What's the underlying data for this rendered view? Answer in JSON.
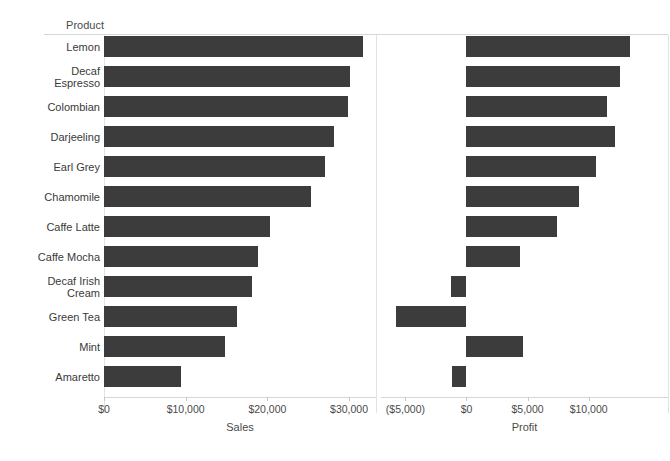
{
  "header": {
    "field_caption": "Product"
  },
  "chart_data": {
    "type": "bar",
    "title": "",
    "orientation": "horizontal",
    "categories": [
      "Lemon",
      "Decaf Espresso",
      "Colombian",
      "Darjeeling",
      "Earl Grey",
      "Chamomile",
      "Caffe Latte",
      "Caffe Mocha",
      "Decaf Irish Cream",
      "Green Tea",
      "Mint",
      "Amaretto"
    ],
    "category_label_lines": [
      "Lemon",
      "Decaf\nEspresso",
      "Colombian",
      "Darjeeling",
      "Earl Grey",
      "Chamomile",
      "Caffe Latte",
      "Caffe Mocha",
      "Decaf Irish\nCream",
      "Green Tea",
      "Mint",
      "Amaretto"
    ],
    "panels": [
      {
        "name": "sales",
        "xlabel": "Sales",
        "values": [
          31700,
          30100,
          29900,
          28200,
          27000,
          25400,
          20300,
          18800,
          18100,
          16300,
          14800,
          9400
        ],
        "xlim": [
          0,
          33300
        ],
        "ticks": [
          0,
          10000,
          20000,
          30000
        ],
        "tick_labels": [
          "$0",
          "$10,000",
          "$20,000",
          "$30,000"
        ]
      },
      {
        "name": "profit",
        "xlabel": "Profit",
        "values": [
          13400,
          12600,
          11500,
          12200,
          10600,
          9200,
          7400,
          4400,
          -1300,
          -5800,
          4600,
          -1200
        ],
        "xlim": [
          -7000,
          16500
        ],
        "ticks": [
          -5000,
          0,
          5000,
          10000
        ],
        "tick_labels": [
          "($5,000)",
          "$0",
          "$5,000",
          "$10,000"
        ]
      }
    ],
    "grid": false,
    "legend": "none",
    "bar_color": "#3c3c3c",
    "axis_color": "#d6d6d6"
  }
}
